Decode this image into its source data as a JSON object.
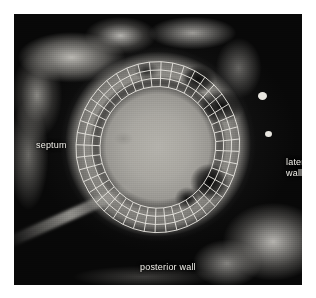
{
  "figure": {
    "modality": "cardiac-short-axis-tomogram",
    "background_color": "#ffffff",
    "frame": {
      "x": 14,
      "y": 14,
      "width": 288,
      "height": 271
    }
  },
  "annotations": {
    "septum": {
      "text": "septum",
      "color": "#f2f0ea",
      "position": "left"
    },
    "lateral_wall": {
      "text": "lateral\nwall",
      "color": "#f2f0ea",
      "position": "right"
    },
    "posterior_wall": {
      "text": "posterior wall",
      "color": "#f2f0ea",
      "position": "bottom"
    }
  },
  "mesh": {
    "label": "myocardial-annular-mesh",
    "stroke_color": "#e6e4de",
    "stroke_width": 1,
    "radial_bands": 3,
    "circumferential_rings": 4,
    "angular_sectors": 44,
    "center": {
      "x": 144,
      "y": 134
    },
    "outer_radius": {
      "rx": 82,
      "ry": 90
    },
    "inner_radius": {
      "rx": 58,
      "ry": 64
    },
    "rotation_deg": -6
  },
  "image_features": {
    "cavity_tone": "#a9a7a1",
    "myocardium_tone": "#a8a69f",
    "background_tone": "#0b0b0b",
    "bright_specks": [
      {
        "x": 262,
        "y": 96,
        "r": 4
      },
      {
        "x": 268,
        "y": 134,
        "r": 3
      }
    ]
  }
}
